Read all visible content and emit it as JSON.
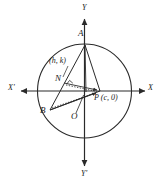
{
  "figure": {
    "type": "geometry-diagram",
    "background_color": "#ffffff",
    "stroke_color": "#2a2a2a"
  },
  "axes": {
    "x_positive_label": "X",
    "x_negative_label": "X'",
    "y_positive_label": "Y",
    "y_negative_label": "Y'",
    "origin_label": "O"
  },
  "points": {
    "a_label": "A",
    "b_label": "B",
    "n_label": "N",
    "p_label": "P (c, 0)",
    "n_coordinates_label": "(h, k)"
  },
  "geometry": {
    "circle": {
      "cx": 84.5,
      "cy": 91,
      "r": 47
    },
    "a": {
      "x": 85,
      "y": 45
    },
    "b": {
      "x": 50,
      "y": 110
    },
    "n": {
      "x": 64,
      "y": 83
    },
    "p": {
      "x": 100,
      "y": 91
    },
    "o": {
      "x": 84.5,
      "y": 91
    }
  }
}
